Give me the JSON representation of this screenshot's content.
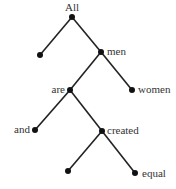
{
  "diagram": {
    "type": "binary-tree",
    "colors": {
      "edge": "#222222",
      "node": "#111111",
      "label": "#333333"
    },
    "nodes": [
      {
        "id": "root",
        "label": "All",
        "x": 72,
        "y": 17
      },
      {
        "id": "leaf1",
        "label": "",
        "x": 40,
        "y": 55
      },
      {
        "id": "men",
        "label": "men",
        "x": 101,
        "y": 52
      },
      {
        "id": "are",
        "label": "are",
        "x": 70,
        "y": 90
      },
      {
        "id": "women",
        "label": "women",
        "x": 132,
        "y": 90
      },
      {
        "id": "and",
        "label": "and",
        "x": 35,
        "y": 130
      },
      {
        "id": "created",
        "label": "created",
        "x": 102,
        "y": 131
      },
      {
        "id": "leaf2",
        "label": "",
        "x": 68,
        "y": 171
      },
      {
        "id": "equal",
        "label": "equal",
        "x": 135,
        "y": 173
      }
    ],
    "edges": [
      [
        "root",
        "leaf1"
      ],
      [
        "root",
        "men"
      ],
      [
        "men",
        "are"
      ],
      [
        "men",
        "women"
      ],
      [
        "are",
        "and"
      ],
      [
        "are",
        "created"
      ],
      [
        "created",
        "leaf2"
      ],
      [
        "created",
        "equal"
      ]
    ]
  }
}
